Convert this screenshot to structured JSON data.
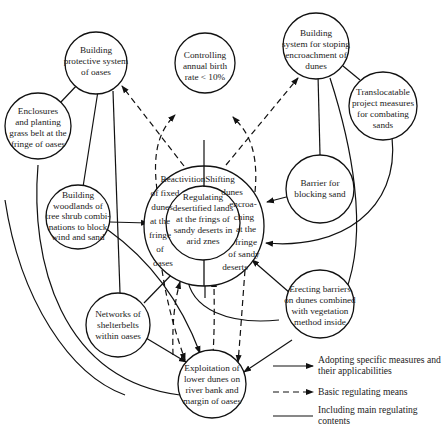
{
  "caption": "ssified rate of geographical conditions depend on the region of ...",
  "nodes": {
    "center_core": {
      "lines": [
        "Regulating",
        "desertified lands",
        "at the frings of",
        "sandy deserts in",
        "arid znes"
      ]
    },
    "center_left": {
      "lines": [
        "Reactivition",
        "of fixed",
        "dunes",
        "at the",
        "fringe",
        "of",
        "oases"
      ]
    },
    "center_right": {
      "lines": [
        "Shifting",
        "dunes",
        "encroa-",
        "ching",
        "at the",
        "fringe",
        "of sandy",
        "deserts"
      ]
    },
    "protective": {
      "lines": [
        "Building",
        "protective system",
        "of oases"
      ]
    },
    "birth": {
      "lines": [
        "Controlling",
        "annual birth",
        "rate < 10%"
      ]
    },
    "stopping": {
      "lines": [
        "Building",
        "system for stoping",
        "encroachment of",
        "dunes"
      ]
    },
    "translocatable": {
      "lines": [
        "Translocatable",
        "project measures",
        "for combating",
        "sands"
      ]
    },
    "enclosures": {
      "lines": [
        "Enclosures",
        "and planting",
        "grass belt at the",
        "fringe of oases"
      ]
    },
    "woodlands": {
      "lines": [
        "Building",
        "woodlands of",
        "tree shrub combi-",
        "nations to block",
        "wind and sand"
      ]
    },
    "barrier": {
      "lines": [
        "Barrier for",
        "blocking sand"
      ]
    },
    "shelterbelts": {
      "lines": [
        "Networks of",
        "shelterbelts",
        "within oases"
      ]
    },
    "erecting": {
      "lines": [
        "Erecting barriers",
        "on dunes combined",
        "with vegetation",
        "method inside"
      ]
    },
    "exploitation": {
      "lines": [
        "Exploitation of",
        "lower dunes on",
        "river bank and",
        "margin of oases"
      ]
    }
  },
  "legend": {
    "items": [
      {
        "type": "solid-arrow",
        "lines": [
          "Adopting specific measures and",
          "their applicabilities"
        ]
      },
      {
        "type": "dashed-arrow",
        "lines": [
          "Basic regulating means"
        ]
      },
      {
        "type": "solid-line",
        "lines": [
          "Including main regulating",
          "contents"
        ]
      }
    ]
  },
  "colors": {
    "stroke": "#111111",
    "text": "#222222",
    "background": "#ffffff"
  }
}
